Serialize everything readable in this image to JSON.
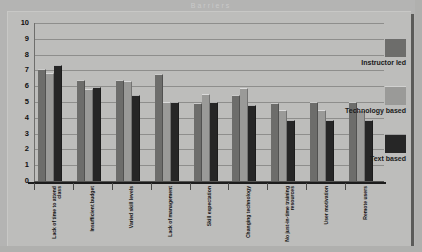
{
  "title": "Barriers",
  "chart_data": {
    "type": "bar",
    "title": "Barriers",
    "xlabel": "",
    "ylabel": "",
    "ylim": [
      0,
      10
    ],
    "yticks": [
      0,
      1,
      2,
      3,
      4,
      5,
      6,
      7,
      8,
      9,
      10
    ],
    "ytick_labels": [
      "0",
      "1",
      "2",
      "3",
      "4",
      "5",
      "6",
      "7",
      "8",
      "9",
      "10"
    ],
    "grid": true,
    "legend_position": "right",
    "categories": [
      "Lack of time to attend class",
      "Insufficient budget",
      "Varied skill levels",
      "Lack of management",
      "Skill expectation",
      "Changing technology",
      "No just-in-time training resources",
      "User motivation",
      "Remote users"
    ],
    "series": [
      {
        "name": "Instructor led",
        "color": "#6d6d6b",
        "values": [
          7.0,
          6.35,
          6.35,
          6.7,
          4.9,
          5.4,
          4.9,
          4.95,
          4.95
        ]
      },
      {
        "name": "Technology based",
        "color": "#9a9a98",
        "values": [
          6.8,
          5.75,
          6.25,
          4.95,
          5.45,
          5.85,
          4.4,
          4.4,
          4.4
        ]
      },
      {
        "name": "Text based",
        "color": "#262626",
        "values": [
          7.25,
          5.9,
          5.4,
          4.95,
          4.95,
          4.75,
          3.8,
          3.8,
          3.8
        ]
      }
    ]
  },
  "legend": {
    "items": [
      {
        "label": "Instructor led",
        "color": "#6d6d6b"
      },
      {
        "label": "Technology based",
        "color": "#9a9a98"
      },
      {
        "label": "Text based",
        "color": "#262626"
      }
    ]
  }
}
